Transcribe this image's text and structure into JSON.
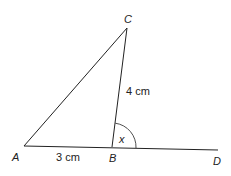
{
  "figure": {
    "points": {
      "A": {
        "label": "A"
      },
      "B": {
        "label": "B"
      },
      "C": {
        "label": "C"
      },
      "D": {
        "label": "D"
      }
    },
    "lengths": {
      "AB": "3 cm",
      "BC": "4 cm"
    },
    "angle_label": "x",
    "stroke_color": "#222222"
  }
}
